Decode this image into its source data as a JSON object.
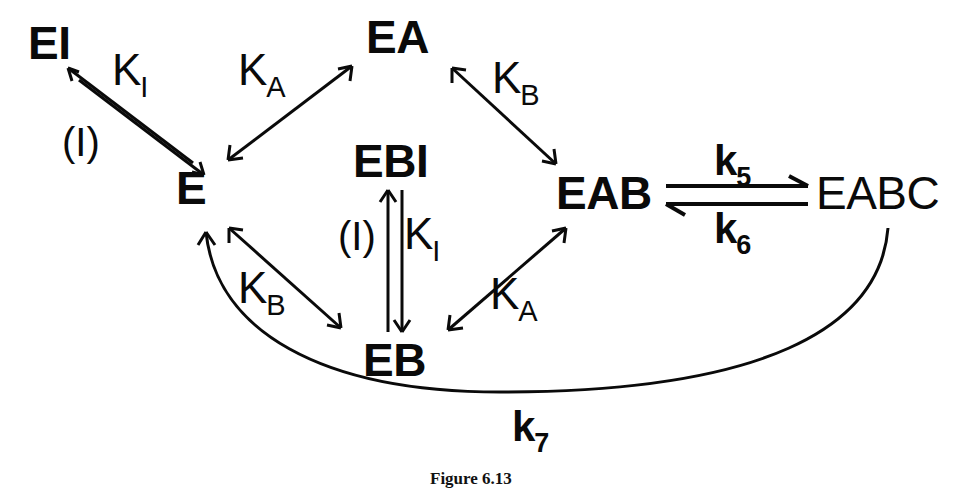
{
  "figure": {
    "caption": "Figure 6.13",
    "caption_x": 430,
    "caption_y": 470,
    "ink_color": "#0a0a0a",
    "background_color": "#ffffff"
  },
  "nodes": [
    {
      "id": "EI",
      "label": "EI",
      "x": 28,
      "y": 20
    },
    {
      "id": "E",
      "label": "E",
      "x": 176,
      "y": 165
    },
    {
      "id": "EA",
      "label": "EA",
      "x": 366,
      "y": 14
    },
    {
      "id": "EBI",
      "label": "EBI",
      "x": 353,
      "y": 138
    },
    {
      "id": "EB",
      "label": "EB",
      "x": 363,
      "y": 337
    },
    {
      "id": "EAB",
      "label": "EAB",
      "x": 556,
      "y": 170
    },
    {
      "id": "EABC",
      "label": "EABC",
      "x": 816,
      "y": 170
    }
  ],
  "edge_labels": [
    {
      "id": "KI-top",
      "base": "K",
      "sub": "I",
      "x": 112,
      "y": 48,
      "style": "equilibrium"
    },
    {
      "id": "I-top",
      "text": "(I)",
      "x": 62,
      "y": 122,
      "style": "paren"
    },
    {
      "id": "KA-top",
      "base": "K",
      "sub": "A",
      "x": 238,
      "y": 48,
      "style": "equilibrium"
    },
    {
      "id": "KB-top",
      "base": "K",
      "sub": "B",
      "x": 492,
      "y": 56,
      "style": "equilibrium"
    },
    {
      "id": "KI-mid",
      "base": "K",
      "sub": "I",
      "x": 404,
      "y": 212,
      "style": "equilibrium"
    },
    {
      "id": "I-mid",
      "text": "(I)",
      "x": 338,
      "y": 216,
      "style": "paren"
    },
    {
      "id": "KB-bottom",
      "base": "K",
      "sub": "B",
      "x": 238,
      "y": 266,
      "style": "equilibrium"
    },
    {
      "id": "KA-bottom",
      "base": "K",
      "sub": "A",
      "x": 490,
      "y": 272,
      "style": "equilibrium"
    },
    {
      "id": "k5",
      "base": "k",
      "sub": "5",
      "x": 714,
      "y": 140,
      "style": "rate"
    },
    {
      "id": "k6",
      "base": "k",
      "sub": "6",
      "x": 714,
      "y": 208,
      "style": "rate"
    },
    {
      "id": "k7",
      "base": "k",
      "sub": "7",
      "x": 512,
      "y": 406,
      "style": "rate"
    }
  ],
  "edges": [
    {
      "id": "EI-E",
      "from": "EI",
      "to": "E",
      "label": "K_I",
      "secondary_label": "(I)",
      "type": "reversible-double-line",
      "direction": "diagonal-down-right"
    },
    {
      "id": "E-EA",
      "from": "E",
      "to": "EA",
      "label": "K_A",
      "type": "double-headed",
      "direction": "diagonal-up-right"
    },
    {
      "id": "EA-EAB",
      "from": "EA",
      "to": "EAB",
      "label": "K_B",
      "type": "double-headed",
      "direction": "diagonal-down-right"
    },
    {
      "id": "E-EB",
      "from": "E",
      "to": "EB",
      "label": "K_B",
      "type": "double-headed",
      "direction": "diagonal-down-right"
    },
    {
      "id": "EB-EAB",
      "from": "EB",
      "to": "EAB",
      "label": "K_A",
      "type": "double-headed",
      "direction": "diagonal-up-right"
    },
    {
      "id": "EBI-EB",
      "from": "EBI",
      "to": "EB",
      "label": "K_I",
      "secondary_label": "(I)",
      "type": "reversible-double-line",
      "direction": "vertical"
    },
    {
      "id": "EAB-EABC",
      "from": "EAB",
      "to": "EABC",
      "label": "k_5",
      "secondary_label": "k_6",
      "type": "reversible-harpoon",
      "direction": "horizontal"
    },
    {
      "id": "EABC-E",
      "from": "EABC",
      "to": "E",
      "label": "k_7",
      "type": "curved-arrow",
      "direction": "curve-bottom-left"
    }
  ]
}
